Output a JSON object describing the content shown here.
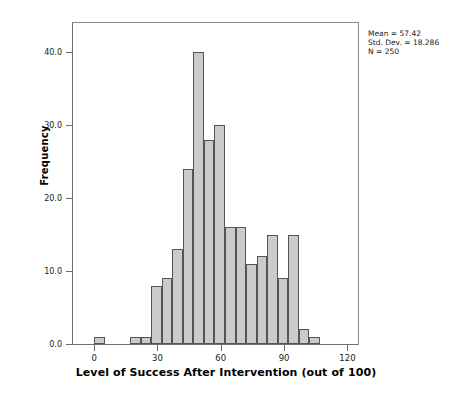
{
  "stats": {
    "mean_label": "Mean = 57.42",
    "stddev_label": "Std. Dev. = 18.286",
    "n_label": "N = 250"
  },
  "chart_data": {
    "type": "bar",
    "title": "",
    "xlabel": "Level of Success After Intervention (out of 100)",
    "ylabel": "Frequency",
    "xlim": [
      -10,
      125
    ],
    "ylim": [
      0,
      44
    ],
    "grid": false,
    "legend": null,
    "bin_width": 5,
    "xticks": [
      0,
      30,
      60,
      90,
      120
    ],
    "xtick_labels": [
      "0",
      "30",
      "60",
      "90",
      "120"
    ],
    "yticks": [
      0,
      10,
      20,
      30,
      40
    ],
    "ytick_labels": [
      "0.0",
      "10.0",
      "20.0",
      "30.0",
      "40.0"
    ],
    "bar_fill": "#cbcbcb",
    "bar_edge": "#555555",
    "bins": [
      {
        "x0": 0,
        "x1": 5,
        "value": 1
      },
      {
        "x0": 17,
        "x1": 22,
        "value": 1
      },
      {
        "x0": 22,
        "x1": 27,
        "value": 1
      },
      {
        "x0": 27,
        "x1": 32,
        "value": 8
      },
      {
        "x0": 32,
        "x1": 37,
        "value": 9
      },
      {
        "x0": 37,
        "x1": 42,
        "value": 13
      },
      {
        "x0": 42,
        "x1": 47,
        "value": 24
      },
      {
        "x0": 47,
        "x1": 52,
        "value": 40
      },
      {
        "x0": 52,
        "x1": 57,
        "value": 28
      },
      {
        "x0": 57,
        "x1": 62,
        "value": 30
      },
      {
        "x0": 62,
        "x1": 67,
        "value": 16
      },
      {
        "x0": 67,
        "x1": 72,
        "value": 16
      },
      {
        "x0": 72,
        "x1": 77,
        "value": 11
      },
      {
        "x0": 77,
        "x1": 82,
        "value": 12
      },
      {
        "x0": 82,
        "x1": 87,
        "value": 15
      },
      {
        "x0": 87,
        "x1": 92,
        "value": 9
      },
      {
        "x0": 92,
        "x1": 97,
        "value": 15
      },
      {
        "x0": 97,
        "x1": 102,
        "value": 2
      },
      {
        "x0": 102,
        "x1": 107,
        "value": 1
      }
    ]
  }
}
